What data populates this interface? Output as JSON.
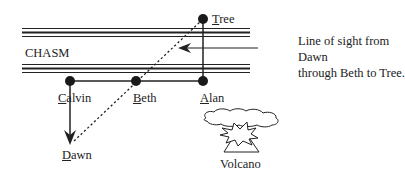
{
  "diagram": {
    "region_label": "CHASM",
    "people": [
      {
        "name": "Tree",
        "underlined_initial": "T"
      },
      {
        "name": "Alan",
        "underlined_initial": "A"
      },
      {
        "name": "Beth",
        "underlined_initial": "B"
      },
      {
        "name": "Calvin",
        "underlined_initial": "C"
      },
      {
        "name": "Dawn",
        "underlined_initial": "D"
      }
    ],
    "caption_line1": "Line of sight from Dawn",
    "caption_line2": "through Beth to Tree.",
    "volcano_label": "Volcano",
    "colors": {
      "ink": "#222222",
      "background": "#ffffff"
    }
  }
}
